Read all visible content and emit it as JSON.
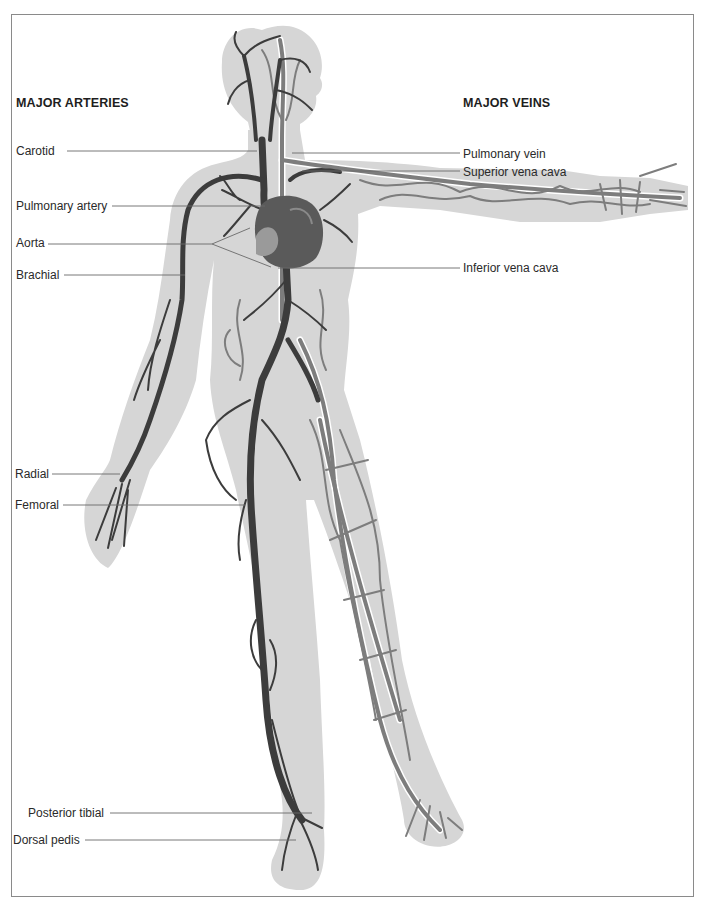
{
  "figure": {
    "colors": {
      "silhouette": "#d6d6d6",
      "artery": "#3c3c3c",
      "vein": "#7d7d7d",
      "vein_outline": "#ffffff",
      "leader_line": "#6a6a6a",
      "frame": "#8a8a8a"
    }
  },
  "arteries": {
    "heading": "MAJOR ARTERIES",
    "labels": [
      {
        "id": "carotid",
        "text": "Carotid"
      },
      {
        "id": "pulmonary-artery",
        "text": "Pulmonary artery"
      },
      {
        "id": "aorta",
        "text": "Aorta"
      },
      {
        "id": "brachial",
        "text": "Brachial"
      },
      {
        "id": "radial",
        "text": "Radial"
      },
      {
        "id": "femoral",
        "text": "Femoral"
      },
      {
        "id": "posterior-tibial",
        "text": "Posterior tibial"
      },
      {
        "id": "dorsal-pedis",
        "text": "Dorsal pedis"
      }
    ]
  },
  "veins": {
    "heading": "MAJOR VEINS",
    "labels": [
      {
        "id": "pulmonary-vein",
        "text": "Pulmonary vein"
      },
      {
        "id": "superior-vena-cava",
        "text": "Superior vena cava"
      },
      {
        "id": "inferior-vena-cava",
        "text": "Inferior vena cava"
      }
    ]
  }
}
